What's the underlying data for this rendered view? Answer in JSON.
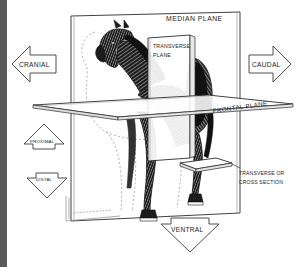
{
  "figure": {
    "background_color": "#ffffff",
    "ink_color": "#1c1c1c",
    "gutter_color": "#5a5a5a"
  },
  "planes": [
    {
      "id": "median",
      "label": "MEDIAN  PLANE",
      "label_position": "top-right-inside",
      "orientation": "vertical-sagittal"
    },
    {
      "id": "transverse",
      "label_line1": "TRANSVERSE",
      "label_line2": "PLANE",
      "label_position": "upper-middle-inside",
      "orientation": "vertical-cross"
    },
    {
      "id": "frontal",
      "label": "FRONTAL PLANE",
      "label_position": "along-right-edge-rotated",
      "orientation": "horizontal"
    },
    {
      "id": "cross-section",
      "label_line1": "TRANSVERSE  OR",
      "label_line2": "CROSS  SECTION",
      "label_position": "lower-right",
      "orientation": "horizontal-small"
    }
  ],
  "direction_arrows": [
    {
      "id": "cranial",
      "label": "CRANIAL",
      "direction": "left",
      "shape": "arrow-left"
    },
    {
      "id": "caudal",
      "label": "CAUDAL",
      "direction": "right",
      "shape": "arrow-right"
    },
    {
      "id": "proximal",
      "label": "PROXIMAL",
      "direction": "up",
      "shape": "arrow-up"
    },
    {
      "id": "distal",
      "label": "DISTAL",
      "direction": "down",
      "shape": "arrow-down"
    },
    {
      "id": "ventral",
      "label": "VENTRAL",
      "direction": "down",
      "shape": "arrow-down"
    }
  ]
}
